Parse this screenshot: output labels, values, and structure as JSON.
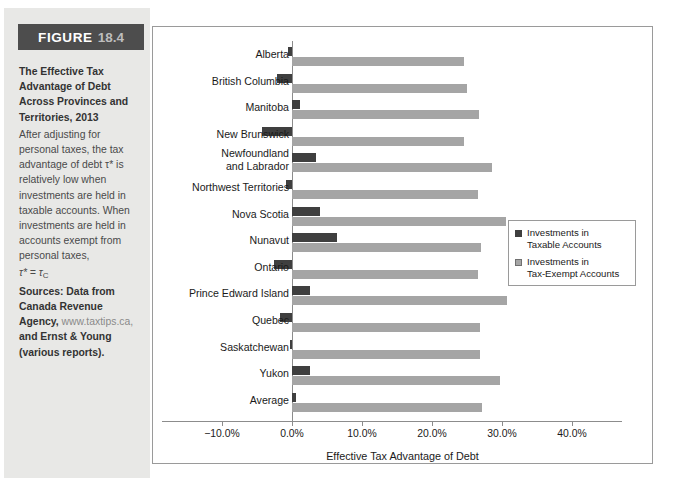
{
  "figure": {
    "banner_word": "FIGURE",
    "banner_number": "18.4",
    "title": "The Effective Tax Advantage of Debt Across Provinces and Territories, 2013",
    "body": "After adjusting for personal taxes, the tax advantage of debt τ* is relatively low when investments are held in taxable accounts. When investments are held in accounts exempt from personal taxes,",
    "formula": "τ* = τ",
    "formula_sub": "C",
    "sources_label": "Sources: Data from Canada Revenue Agency,",
    "sources_url": "www.taxtips.ca,",
    "sources_tail": "and Ernst & Young (various reports)."
  },
  "colors": {
    "banner_bg": "#4d4d4d",
    "panel_bg": "#e8e8e6",
    "taxable": "#3f3f3f",
    "exempt": "#a5a5a5",
    "axis": "#8c8c8c"
  },
  "legend": {
    "items": [
      {
        "label": "Investments in\nTaxable Accounts",
        "swatch": "taxable"
      },
      {
        "label": "Investments in\nTax-Exempt Accounts",
        "swatch": "exempt"
      }
    ]
  },
  "chart_data": {
    "type": "bar",
    "orientation": "horizontal",
    "title": "",
    "xlabel": "Effective Tax Advantage of Debt",
    "ylabel": "",
    "xlim": [
      -10.0,
      40.0
    ],
    "xticks": [
      -10.0,
      0.0,
      10.0,
      20.0,
      30.0,
      40.0
    ],
    "xtick_labels": [
      "−10.0%",
      "0.0%",
      "10.0%",
      "20.0%",
      "30.0%",
      "40.0%"
    ],
    "grid": false,
    "legend_position": "right",
    "categories": [
      "Alberta",
      "British Columbia",
      "Manitoba",
      "New Brunswick",
      "Newfoundland\nand Labrador",
      "Northwest Territories",
      "Nova Scotia",
      "Nunavut",
      "Ontario",
      "Prince Edward Island",
      "Quebec",
      "Saskatchewan",
      "Yukon",
      "Average"
    ],
    "series": [
      {
        "name": "Investments in Taxable Accounts",
        "values": [
          -0.6,
          -2.2,
          1.1,
          -4.3,
          3.4,
          -0.9,
          4.0,
          6.4,
          -2.6,
          2.6,
          -1.7,
          -0.3,
          2.5,
          0.6
        ]
      },
      {
        "name": "Investments in Tax-Exempt Accounts",
        "values": [
          24.5,
          25.0,
          26.7,
          24.5,
          28.5,
          26.5,
          30.5,
          27.0,
          26.5,
          30.7,
          26.8,
          26.9,
          29.7,
          27.2
        ]
      }
    ]
  }
}
